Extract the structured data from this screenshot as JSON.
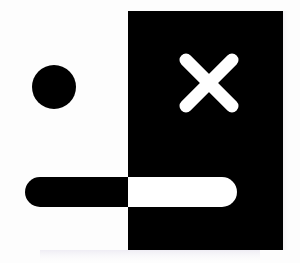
{
  "graphic": {
    "title": "Abstract high-contrast icon composition",
    "canvas": {
      "width": 300,
      "height": 263,
      "background_color": "#fdfdfd"
    },
    "palette": {
      "ink": "#000000",
      "paper": "#ffffff",
      "background": "#fdfdfd",
      "edge_tint": "#f2f0f4",
      "shadow_tint": "#eceaf2"
    },
    "shapes": [
      {
        "name": "panel-rectangle",
        "kind": "rectangle",
        "fill_color": "#000000",
        "x": 128,
        "y": 11,
        "width": 155,
        "height": 239
      },
      {
        "name": "dot-circle",
        "kind": "circle",
        "fill_color": "#000000",
        "cx": 54,
        "cy": 87,
        "r": 22
      },
      {
        "name": "bar-pill",
        "kind": "pill",
        "description": "horizontal rounded bar, black outside panel and white inside panel",
        "x": 25,
        "y": 177,
        "width": 212,
        "height": 30,
        "radius": 15,
        "fill_outside_panel": "#000000",
        "fill_inside_panel": "#ffffff"
      },
      {
        "name": "close-x-mark",
        "kind": "x-cross",
        "fill_color": "#ffffff",
        "cx": 209,
        "cy": 83,
        "arm_length": 46,
        "stroke_width": 13,
        "stroke_linecap": "round"
      }
    ]
  },
  "labels": {
    "panel": "Panel",
    "dot": "Dot",
    "bar": "Bar",
    "close": "Close"
  }
}
